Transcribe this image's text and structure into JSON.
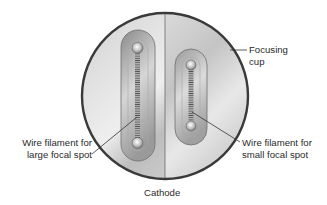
{
  "figure": {
    "title": "Cathode",
    "labels": {
      "focusing_cup": [
        "Focusing",
        "cup"
      ],
      "large_filament": [
        "Wire filament for",
        "large focal spot"
      ],
      "small_filament": [
        "Wire filament for",
        "small focal spot"
      ]
    }
  },
  "colors": {
    "outline": "#3a3a3a",
    "cup_light": "#e6e6e6",
    "cup_dark": "#b4b4b4",
    "slot_dark": "#8e8e8e",
    "leader": "#333333",
    "text": "#2a2a2a"
  }
}
